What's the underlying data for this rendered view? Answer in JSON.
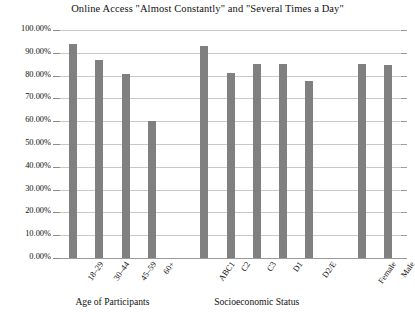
{
  "chart_data": {
    "type": "bar",
    "title": "Online Access \"Almost Constantly\" and \"Several Times a Day\"",
    "xlabel": "",
    "ylabel": "",
    "ylim": [
      0,
      100
    ],
    "grid": true,
    "legend": "none",
    "y_unit": "%",
    "categories": [
      "18–29",
      "30–44",
      "45–59",
      "60+",
      "ABC1",
      "C2",
      "C3",
      "D1",
      "D2/E",
      "Female",
      "Male"
    ],
    "values": [
      94.0,
      87.0,
      80.5,
      60.0,
      93.0,
      81.0,
      85.0,
      85.0,
      77.5,
      85.0,
      84.5
    ],
    "ytick_labels": [
      "0.00%",
      "10.00%",
      "20.00%",
      "30.00%",
      "40.00%",
      "50.00%",
      "60.00%",
      "70.00%",
      "80.00%",
      "90.00%",
      "100.00%"
    ],
    "ytick_values": [
      0,
      10,
      20,
      30,
      40,
      50,
      60,
      70,
      80,
      90,
      100
    ],
    "groups": [
      {
        "label": "Age of Participants",
        "categories": [
          "18–29",
          "30–44",
          "45–59",
          "60+"
        ]
      },
      {
        "label": "Socioeconomic Status",
        "categories": [
          "ABC1",
          "C2",
          "C3",
          "D1",
          "D2/E"
        ]
      },
      {
        "label": "",
        "categories": [
          "Female",
          "Male"
        ]
      }
    ],
    "colors": {
      "bar": "#808080",
      "gridline": "#c9c9c9",
      "axis": "#9a9a9a",
      "text": "#111111",
      "background": "#ffffff"
    }
  }
}
